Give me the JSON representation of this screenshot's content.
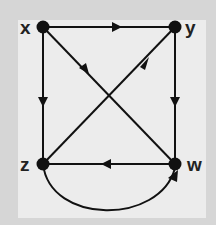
{
  "diagram": {
    "type": "directed-graph",
    "colors": {
      "background_outer": "#d6d6d6",
      "background_inner": "#ececec",
      "ink": "#111111"
    },
    "nodes": [
      {
        "id": "x",
        "label": "x"
      },
      {
        "id": "y",
        "label": "y"
      },
      {
        "id": "z",
        "label": "z"
      },
      {
        "id": "w",
        "label": "w"
      }
    ],
    "edges": [
      {
        "from": "x",
        "to": "y"
      },
      {
        "from": "x",
        "to": "z"
      },
      {
        "from": "x",
        "to": "w"
      },
      {
        "from": "z",
        "to": "y"
      },
      {
        "from": "y",
        "to": "w"
      },
      {
        "from": "w",
        "to": "z"
      },
      {
        "from": "z",
        "to": "w",
        "curved": true
      }
    ]
  }
}
